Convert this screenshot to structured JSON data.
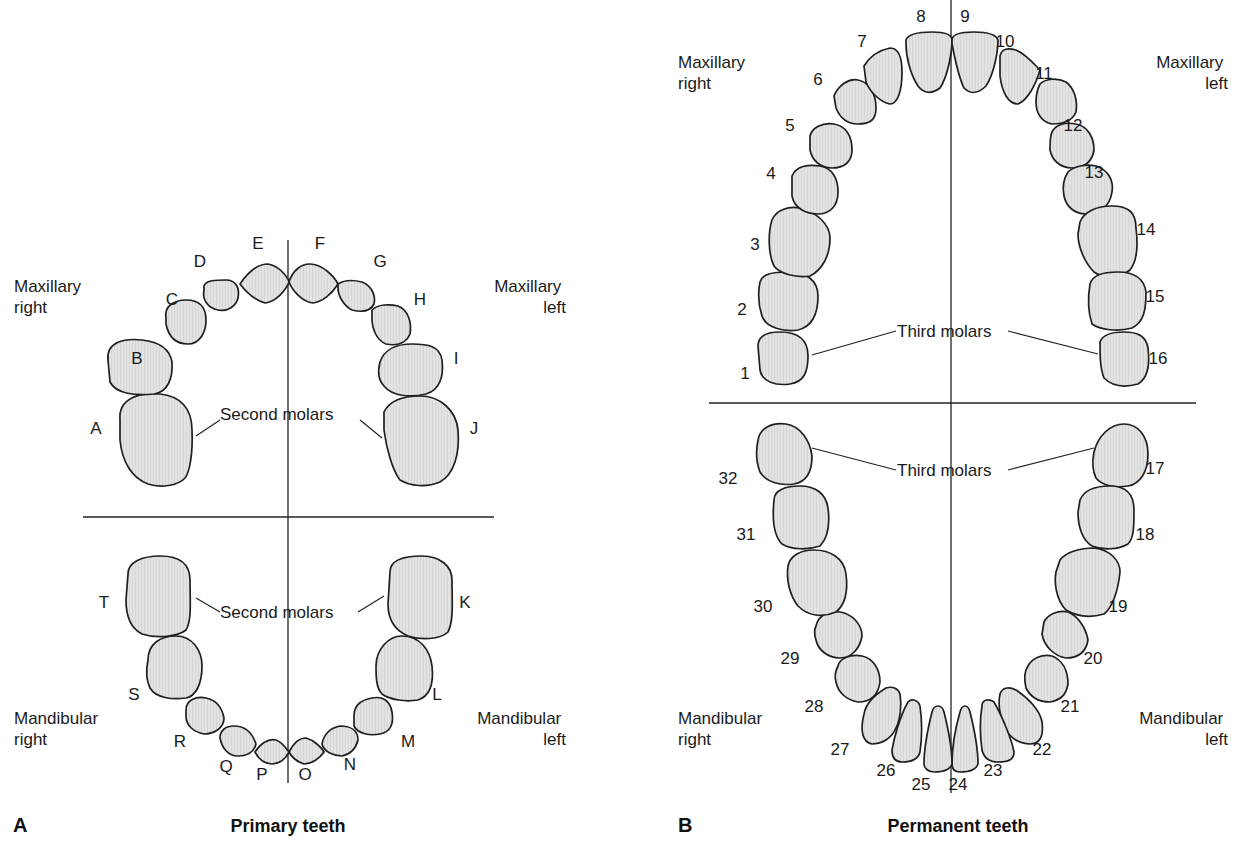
{
  "colors": {
    "tooth_fill": "#e3e3e3",
    "tooth_hatch": "#d2d2d2",
    "outline": "#1f1f1f",
    "background": "#ffffff"
  },
  "panelA": {
    "letter": "A",
    "title": "Primary teeth",
    "quadrants": {
      "max_right": [
        "Maxillary",
        "right"
      ],
      "max_left": [
        "Maxillary",
        "left"
      ],
      "man_right": [
        "Mandibular",
        "right"
      ],
      "man_left": [
        "Mandibular",
        "left"
      ]
    },
    "annotations": {
      "upper": "Second molars",
      "lower": "Second molars"
    },
    "lines": {
      "vx": 288,
      "vy1": 240,
      "vy2": 783,
      "hy": 517,
      "hx1": 83,
      "hx2": 494
    },
    "teeth": [
      {
        "id": "A",
        "lx": 96,
        "ly": 434,
        "d": "M120,420 C118,398 140,392 160,394 C180,396 192,408 192,430 C193,452 190,472 185,478 C178,486 160,488 148,484 C132,478 122,462 120,440 Z"
      },
      {
        "id": "B",
        "lx": 137,
        "ly": 364,
        "d": "M108,360 C106,342 124,338 142,340 C160,342 170,350 172,362 C173,378 168,392 154,394 C136,396 116,394 110,382 Z"
      },
      {
        "id": "C",
        "lx": 172,
        "ly": 305,
        "d": "M166,318 C164,306 174,300 186,300 C198,300 206,306 206,320 C206,332 200,344 188,344 C174,344 168,334 166,324 Z"
      },
      {
        "id": "D",
        "lx": 200,
        "ly": 267,
        "d": "M204,286 C206,280 216,280 226,280 C236,280 240,288 238,298 C236,306 228,312 218,310 C208,308 202,300 204,290 Z"
      },
      {
        "id": "E",
        "lx": 258,
        "ly": 249,
        "d": "M240,284 C248,272 258,264 268,264 C280,266 288,278 289,282 C286,290 276,302 265,303 C255,300 246,292 240,284 Z"
      },
      {
        "id": "F",
        "lx": 320,
        "ly": 249,
        "d": "M289,282 C292,272 300,264 310,264 C322,264 334,276 338,284 C332,294 322,302 313,303 C302,302 292,290 289,282 Z"
      },
      {
        "id": "G",
        "lx": 380,
        "ly": 267,
        "d": "M338,284 C344,280 354,280 362,282 C372,286 376,296 374,304 C370,312 360,312 352,310 C344,306 338,296 338,288 Z"
      },
      {
        "id": "H",
        "lx": 420,
        "ly": 305,
        "d": "M372,310 C378,304 390,304 398,306 C408,310 412,322 410,334 C406,344 396,346 386,344 C376,340 372,328 372,318 Z"
      },
      {
        "id": "I",
        "lx": 456,
        "ly": 364,
        "d": "M380,362 C384,350 396,344 412,344 C428,344 440,346 442,360 C444,376 440,390 426,394 C410,398 392,396 384,386 C378,380 378,370 380,362 Z"
      },
      {
        "id": "J",
        "lx": 474,
        "ly": 434,
        "d": "M384,412 C390,400 404,396 420,396 C440,396 456,410 458,430 C460,454 454,474 440,482 C426,488 410,486 400,480 C392,470 386,446 384,430 Z"
      },
      {
        "id": "K",
        "lx": 465,
        "ly": 608,
        "d": "M390,572 C390,560 404,556 422,556 C440,556 452,566 452,580 C452,600 454,620 448,632 C440,640 420,640 408,636 C394,630 388,620 388,604 Z"
      },
      {
        "id": "L",
        "lx": 437,
        "ly": 700,
        "d": "M376,666 C376,650 388,636 402,636 C420,636 430,650 432,666 C434,684 430,696 418,700 C406,702 390,700 382,694 C376,688 376,676 376,666 Z"
      },
      {
        "id": "M",
        "lx": 408,
        "ly": 747,
        "d": "M354,716 C354,704 362,700 372,698 C382,696 390,700 392,712 C394,724 390,732 380,734 C370,736 358,734 354,726 Z"
      },
      {
        "id": "N",
        "lx": 350,
        "ly": 770,
        "d": "M322,744 C324,734 330,728 340,726 C350,726 358,730 358,740 C356,748 352,754 342,756 C334,756 324,752 322,744 Z"
      },
      {
        "id": "O",
        "lx": 305,
        "ly": 780,
        "d": "M289,752 C294,742 300,738 306,738 C314,740 322,748 324,752 C320,758 312,764 304,764 C298,762 292,758 289,752 Z"
      },
      {
        "id": "P",
        "lx": 262,
        "ly": 780,
        "d": "M255,752 C260,744 268,738 276,740 C282,742 286,748 289,752 C286,758 280,764 272,764 C264,764 258,758 255,752 Z"
      },
      {
        "id": "Q",
        "lx": 226,
        "ly": 772,
        "d": "M220,738 C220,730 226,726 234,726 C244,726 252,732 256,744 C254,752 248,756 238,756 C228,756 222,748 220,738 Z"
      },
      {
        "id": "R",
        "lx": 180,
        "ly": 747,
        "d": "M186,710 C186,700 196,696 206,698 C216,700 222,708 224,718 C224,728 214,734 204,734 C194,732 186,726 186,716 Z"
      },
      {
        "id": "S",
        "lx": 134,
        "ly": 700,
        "d": "M148,660 C148,644 160,636 176,636 C192,636 202,650 202,666 C202,684 196,696 186,698 C172,700 156,698 150,688 C146,680 146,670 148,660 Z"
      },
      {
        "id": "T",
        "lx": 104,
        "ly": 608,
        "d": "M128,574 C128,562 142,556 160,556 C180,556 190,564 190,580 C190,600 192,620 186,630 C176,638 154,638 142,634 C130,628 126,616 126,600 Z"
      }
    ]
  },
  "panelB": {
    "letter": "B",
    "title": "Permanent teeth",
    "quadrants": {
      "max_right": [
        "Maxillary",
        "right"
      ],
      "max_left": [
        "Maxillary",
        "left"
      ],
      "man_right": [
        "Mandibular",
        "right"
      ],
      "man_left": [
        "Mandibular",
        "left"
      ]
    },
    "annotations": {
      "upper": "Third molars",
      "lower": "Third molars"
    },
    "lines": {
      "vx": 951,
      "vy1": 0,
      "vy2": 793,
      "hy": 403,
      "hx1": 709,
      "hx2": 1196
    },
    "teeth": [
      {
        "id": "1",
        "lx": 745,
        "ly": 379,
        "d": "M758,346 C758,336 766,332 780,332 C796,332 808,338 808,356 C808,372 804,382 790,384 C776,386 762,382 760,370 Z"
      },
      {
        "id": "2",
        "lx": 742,
        "ly": 315,
        "d": "M760,282 C762,274 772,272 788,272 C806,272 818,280 818,296 C818,312 814,326 798,330 C784,332 766,328 762,316 C758,304 758,292 760,282 Z"
      },
      {
        "id": "3",
        "lx": 755,
        "ly": 250,
        "d": "M772,220 C776,210 788,206 800,208 C816,212 830,224 830,238 C830,256 822,270 810,276 C796,278 780,274 774,266 C768,254 768,232 772,220 Z"
      },
      {
        "id": "4",
        "lx": 771,
        "ly": 179,
        "d": "M792,176 C796,166 808,164 820,166 C832,168 838,178 838,192 C838,206 830,214 818,214 C806,214 794,208 792,196 Z"
      },
      {
        "id": "5",
        "lx": 790,
        "ly": 131,
        "d": "M810,136 C812,128 822,122 834,124 C846,126 852,136 852,150 C852,162 844,168 832,168 C820,168 812,160 810,150 Z"
      },
      {
        "id": "6",
        "lx": 818,
        "ly": 85,
        "d": "M834,96 C838,86 848,78 858,80 C868,82 876,92 876,108 C876,120 870,124 858,124 C848,124 840,118 836,108 Z"
      },
      {
        "id": "7",
        "lx": 862,
        "ly": 47,
        "d": "M864,66 C870,56 880,50 890,48 C898,48 902,56 902,72 C902,90 898,104 890,104 C880,102 870,92 866,82 Z"
      },
      {
        "id": "8",
        "lx": 921,
        "ly": 22,
        "d": "M906,40 C908,34 918,32 932,32 C944,32 952,34 952,40 C952,52 948,76 940,88 C932,94 924,94 918,86 C910,74 906,56 906,44 Z"
      },
      {
        "id": "9",
        "lx": 965,
        "ly": 22,
        "d": "M952,40 C952,34 960,32 974,32 C986,32 996,34 998,40 C998,52 994,74 986,86 C978,94 970,94 964,88 C958,76 954,54 952,44 Z"
      },
      {
        "id": "10",
        "lx": 1005,
        "ly": 47,
        "d": "M1000,56 C1002,48 1008,48 1016,50 C1026,54 1034,64 1040,70 C1036,84 1028,100 1018,104 C1008,104 1002,92 1000,76 Z"
      },
      {
        "id": "11",
        "lx": 1044,
        "ly": 79,
        "d": "M1040,84 C1046,78 1058,78 1066,82 C1074,88 1078,100 1076,112 C1072,122 1062,124 1052,124 C1042,122 1036,114 1036,102 C1036,94 1038,88 1040,84 Z"
      },
      {
        "id": "12",
        "lx": 1073,
        "ly": 131,
        "d": "M1052,132 C1056,124 1066,122 1076,124 C1088,126 1094,138 1094,150 C1092,162 1084,168 1072,168 C1060,168 1052,160 1050,150 C1050,142 1050,136 1052,132 Z"
      },
      {
        "id": "13",
        "lx": 1094,
        "ly": 178,
        "d": "M1068,172 C1074,166 1086,164 1096,166 C1108,170 1114,180 1112,192 C1110,206 1100,214 1086,214 C1074,214 1066,206 1064,196 C1062,186 1064,178 1068,172 Z"
      },
      {
        "id": "14",
        "lx": 1146,
        "ly": 235,
        "d": "M1080,222 C1084,212 1096,206 1112,206 C1128,206 1136,212 1136,228 C1138,244 1138,260 1130,270 C1120,278 1102,278 1094,272 C1084,262 1078,246 1078,234 Z"
      },
      {
        "id": "15",
        "lx": 1155,
        "ly": 302,
        "d": "M1090,284 C1092,276 1102,272 1118,272 C1134,272 1144,278 1146,292 C1146,310 1144,322 1132,328 C1118,332 1100,330 1092,324 C1088,312 1088,296 1090,284 Z"
      },
      {
        "id": "16",
        "lx": 1158,
        "ly": 364,
        "d": "M1100,342 C1102,336 1110,332 1124,332 C1138,332 1146,336 1148,348 C1150,364 1148,378 1138,384 C1124,388 1112,386 1104,378 C1100,368 1100,356 1100,342 Z"
      },
      {
        "id": "17",
        "lx": 1155,
        "ly": 474,
        "d": "M1094,452 C1098,436 1110,424 1124,424 C1138,424 1148,436 1148,454 C1148,472 1140,484 1128,486 C1116,488 1102,486 1096,478 C1092,470 1092,462 1094,452 Z"
      },
      {
        "id": "18",
        "lx": 1145,
        "ly": 540,
        "d": "M1080,500 C1084,490 1096,486 1110,486 C1126,486 1134,494 1134,510 C1134,526 1134,538 1128,544 C1118,550 1102,550 1092,546 C1082,540 1078,526 1078,512 Z"
      },
      {
        "id": "19",
        "lx": 1118,
        "ly": 612,
        "d": "M1060,560 C1066,552 1080,548 1094,548 C1110,550 1120,560 1120,572 C1118,592 1112,608 1104,614 C1090,618 1076,616 1066,610 C1056,600 1054,582 1056,572 Z"
      },
      {
        "id": "20",
        "lx": 1093,
        "ly": 664,
        "d": "M1044,622 C1048,614 1058,610 1068,612 C1078,616 1086,628 1088,640 C1086,652 1078,658 1066,658 C1054,656 1044,646 1042,634 Z"
      },
      {
        "id": "21",
        "lx": 1070,
        "ly": 712,
        "d": "M1028,666 C1032,658 1042,654 1052,656 C1062,660 1068,670 1068,684 C1066,696 1060,700 1050,702 C1038,702 1030,696 1026,688 C1024,680 1024,672 1028,666 Z"
      },
      {
        "id": "22",
        "lx": 1042,
        "ly": 755,
        "d": "M1000,694 C1002,688 1008,686 1016,690 C1028,698 1040,710 1042,722 C1044,736 1040,744 1030,744 C1018,744 1008,736 1004,726 C1000,716 998,704 1000,694 Z"
      },
      {
        "id": "23",
        "lx": 993,
        "ly": 776,
        "d": "M982,706 C982,700 988,698 994,702 C1002,716 1012,740 1014,752 C1014,760 1008,762 998,762 C990,762 984,758 982,750 C980,736 980,718 982,706 Z"
      },
      {
        "id": "24",
        "lx": 958,
        "ly": 790,
        "d": "M952,764 C952,748 956,726 960,712 C962,704 968,704 970,712 C974,728 978,748 978,764 C976,770 968,772 960,772 C954,772 952,768 952,764 Z"
      },
      {
        "id": "25",
        "lx": 921,
        "ly": 790,
        "d": "M924,764 C924,748 928,728 932,712 C934,704 942,704 944,712 C948,728 952,748 952,764 C950,770 942,772 934,772 C928,772 924,768 924,764 Z"
      },
      {
        "id": "26",
        "lx": 886,
        "ly": 776,
        "d": "M892,750 C894,738 900,716 908,702 C912,698 918,700 920,706 C922,720 922,738 920,752 C918,760 910,762 902,762 C896,762 892,758 892,750 Z"
      },
      {
        "id": "27",
        "lx": 840,
        "ly": 755,
        "d": "M864,714 C866,702 876,694 886,688 C892,686 898,688 900,694 C902,706 900,720 896,728 C892,738 882,744 872,744 C862,742 860,730 864,714 Z"
      },
      {
        "id": "28",
        "lx": 814,
        "ly": 712,
        "d": "M838,666 C840,658 850,654 862,656 C872,658 880,668 880,682 C878,696 870,702 858,702 C846,700 838,692 836,682 C834,676 836,670 838,666 Z"
      },
      {
        "id": "29",
        "lx": 790,
        "ly": 664,
        "d": "M816,626 C818,616 828,610 840,612 C852,614 862,624 862,636 C860,648 852,658 840,658 C828,658 818,650 816,640 C814,634 814,630 816,626 Z"
      },
      {
        "id": "30",
        "lx": 763,
        "ly": 612,
        "d": "M788,566 C790,556 800,550 814,550 C830,550 844,558 846,574 C848,590 846,604 836,612 C822,618 808,616 798,606 C790,596 786,580 788,566 Z"
      },
      {
        "id": "31",
        "lx": 746,
        "ly": 540,
        "d": "M774,500 C774,490 786,486 800,486 C816,486 826,494 828,508 C830,524 828,538 820,546 C808,550 792,550 782,544 C774,536 772,520 774,500 Z"
      },
      {
        "id": "32",
        "lx": 728,
        "ly": 484,
        "d": "M758,440 C760,428 772,422 786,424 C800,426 810,440 812,456 C812,472 806,482 794,484 C780,486 766,482 760,472 C756,462 756,450 758,440 Z"
      }
    ]
  }
}
